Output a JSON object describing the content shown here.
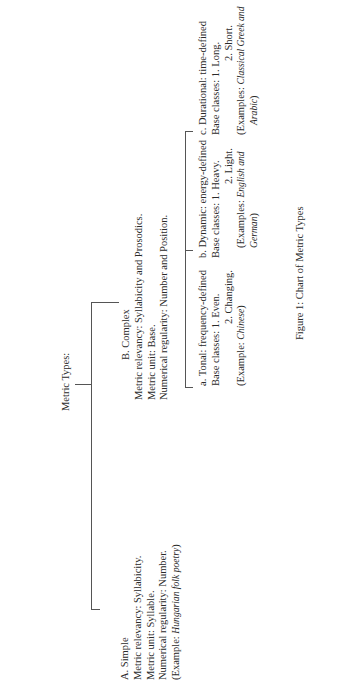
{
  "diagram": {
    "root": {
      "label": "Metric Types:"
    },
    "simple": {
      "heading": "A. Simple",
      "relevancy": "Metric relevancy: Syllabicity.",
      "unit": "Metric unit: Syllable.",
      "regularity": "Numerical regularity: Number.",
      "example_prefix": "(Example: ",
      "example_italic": "Hungarian folk poetry",
      "example_suffix": ")"
    },
    "complex": {
      "heading": "B. Complex",
      "relevancy": "Metric relevancy: Syllabicity and Prosodics.",
      "unit": "Metric unit: Base.",
      "regularity": "Numerical regularity: Number and Position."
    },
    "tonal": {
      "heading": "a. Tonal: frequency-defined",
      "classes_1": "Base classes: 1. Even.",
      "classes_2": "2. Changing.",
      "example_prefix": "(Example: ",
      "example_italic": "Chinese",
      "example_suffix": ")"
    },
    "dynamic": {
      "heading": "b. Dynamic: energy-defined",
      "classes_1": "Base classes: 1. Heavy.",
      "classes_2": "2. Light.",
      "example_prefix": "(Examples: ",
      "example_italic_1": "English and",
      "example_italic_2": "German",
      "example_suffix": ")"
    },
    "durational": {
      "heading": "c. Durational: time-defined",
      "classes_1": "Base classes: 1. Long.",
      "classes_2": "2. Short.",
      "example_prefix": "(Examples: ",
      "example_italic_1": "Classical Greek and",
      "example_italic_2": "Arabic",
      "example_suffix": ")"
    },
    "caption": "Figure 1: Chart of Metric Types"
  }
}
